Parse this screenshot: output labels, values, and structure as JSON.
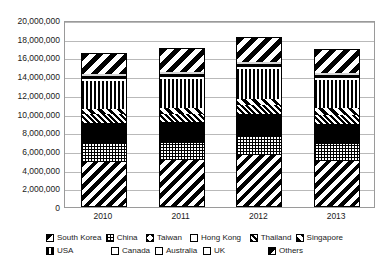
{
  "chart_data": {
    "type": "bar",
    "stacked": true,
    "title": "",
    "xlabel": "",
    "ylabel": "",
    "ylim": [
      0,
      20000000
    ],
    "ytick_step": 2000000,
    "grid": true,
    "legend_position": "bottom",
    "categories": [
      "2010",
      "2011",
      "2012",
      "2013"
    ],
    "ytick_labels": [
      "20,000,000",
      "18,000,000",
      "16,000,000",
      "14,000,000",
      "12,000,000",
      "10,000,000",
      "8,000,000",
      "6,000,000",
      "4,000,000",
      "2,000,000",
      "0"
    ],
    "series": [
      {
        "name": "South Korea",
        "pattern": "p-southkorea",
        "values": [
          4800000,
          5000000,
          5600000,
          4900000
        ]
      },
      {
        "name": "China",
        "pattern": "p-china",
        "values": [
          1900000,
          1900000,
          2000000,
          1800000
        ]
      },
      {
        "name": "Taiwan",
        "pattern": "p-taiwan",
        "values": [
          700000,
          700000,
          800000,
          700000
        ]
      },
      {
        "name": "Hong Kong",
        "pattern": "p-hongkong",
        "values": [
          1600000,
          1500000,
          1600000,
          1500000
        ]
      },
      {
        "name": "Thailand",
        "pattern": "p-thailand",
        "values": [
          900000,
          900000,
          900000,
          900000
        ]
      },
      {
        "name": "Singapore",
        "pattern": "p-singapore",
        "values": [
          600000,
          600000,
          700000,
          800000
        ]
      },
      {
        "name": "USA",
        "pattern": "p-usa",
        "values": [
          3000000,
          3100000,
          3200000,
          3000000
        ]
      },
      {
        "name": "Canada",
        "pattern": "p-canada",
        "values": [
          200000,
          200000,
          200000,
          200000
        ]
      },
      {
        "name": "Australia",
        "pattern": "p-australia",
        "values": [
          300000,
          300000,
          300000,
          300000
        ]
      },
      {
        "name": "UK",
        "pattern": "p-uk",
        "values": [
          200000,
          200000,
          200000,
          200000
        ]
      },
      {
        "name": "Others",
        "pattern": "p-others",
        "values": [
          2300000,
          2600000,
          2700000,
          2600000
        ]
      }
    ],
    "totals": [
      16500000,
      17000000,
      18200000,
      16700000
    ]
  },
  "legend": {
    "row1": [
      {
        "label": "South Korea",
        "pattern": "p-southkorea"
      },
      {
        "label": "China",
        "pattern": "p-china"
      },
      {
        "label": "Taiwan",
        "pattern": "p-taiwan"
      },
      {
        "label": "Hong Kong",
        "pattern": "p-hongkong"
      },
      {
        "label": "Thailand",
        "pattern": "p-thailand"
      },
      {
        "label": "Singapore",
        "pattern": "p-singapore"
      }
    ],
    "row2": [
      {
        "label": "USA",
        "pattern": "p-usa"
      },
      {
        "label": "Canada",
        "pattern": "p-canada"
      },
      {
        "label": "Australia",
        "pattern": "p-australia"
      },
      {
        "label": "UK",
        "pattern": "p-uk"
      },
      {
        "label": "Others",
        "pattern": "p-others"
      }
    ]
  }
}
